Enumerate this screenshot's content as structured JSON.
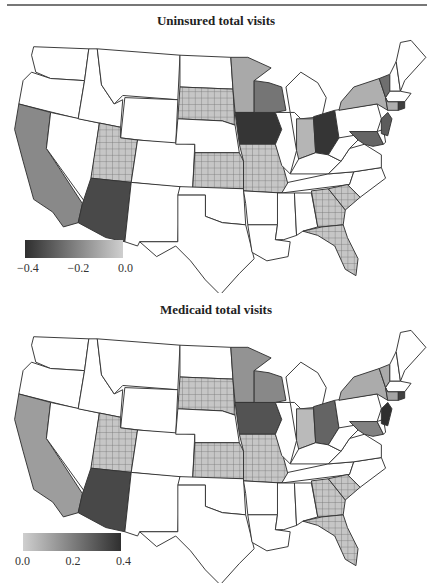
{
  "chart_data": [
    {
      "type": "choropleth",
      "title": "Uninsured total visits",
      "colorbar": {
        "ticks": [
          "−0.4",
          "−0.2",
          "0.0"
        ],
        "range": [
          -0.5,
          0.0
        ],
        "low_color": "#2f2f2f",
        "high_color": "#cfcfcf"
      },
      "hatched_note": "Cross-hatched states: grid-pattern fill",
      "states": {
        "IA": -0.48,
        "OH": -0.48,
        "AZ": -0.42,
        "NJ": -0.36,
        "MD": -0.33,
        "VT": -0.3,
        "WI": -0.28,
        "CA": -0.22,
        "RI": -0.45,
        "MN": -0.12,
        "NY": -0.1,
        "IN": -0.08,
        "CT": -0.1,
        "hatched": [
          "SD",
          "UT",
          "KS",
          "MO",
          "GA",
          "SC",
          "FL"
        ],
        "white": [
          "WA",
          "OR",
          "ID",
          "MT",
          "WY",
          "NV",
          "CO",
          "NM",
          "TX",
          "OK",
          "NE",
          "ND",
          "AR",
          "LA",
          "MS",
          "AL",
          "TN",
          "KY",
          "IL",
          "MI",
          "PA",
          "WV",
          "VA",
          "NC",
          "ME",
          "NH",
          "MA",
          "DE"
        ]
      }
    },
    {
      "type": "choropleth",
      "title": "Medicaid total visits",
      "colorbar": {
        "ticks": [
          "0.0",
          "0.2",
          "0.4"
        ],
        "range": [
          0.0,
          0.45
        ],
        "low_color": "#cfcfcf",
        "high_color": "#2f2f2f"
      },
      "states": {
        "NJ": 0.45,
        "AZ": 0.38,
        "IA": 0.35,
        "OH": 0.3,
        "RI": 0.4,
        "MD": 0.22,
        "WI": 0.2,
        "MN": 0.17,
        "CA": 0.14,
        "NY": 0.1,
        "VT": 0.1,
        "CT": 0.12,
        "IN": 0.06,
        "hatched": [
          "SD",
          "UT",
          "KS",
          "MO",
          "GA",
          "SC",
          "FL"
        ],
        "white": [
          "WA",
          "OR",
          "ID",
          "MT",
          "WY",
          "NV",
          "CO",
          "NM",
          "TX",
          "OK",
          "NE",
          "ND",
          "AR",
          "LA",
          "MS",
          "AL",
          "TN",
          "KY",
          "IL",
          "MI",
          "PA",
          "WV",
          "VA",
          "NC",
          "ME",
          "NH",
          "MA",
          "DE"
        ]
      }
    }
  ],
  "panels": [
    {
      "title": "Uninsured total visits",
      "ticks": [
        "−0.4",
        "−0.2",
        "0.0"
      ]
    },
    {
      "title": "Medicaid total visits",
      "ticks": [
        "0.0",
        "0.2",
        "0.4"
      ]
    }
  ],
  "colors": {
    "darkest": "#2f2f2f",
    "dark": "#4a4a4a",
    "mid": "#6e6e6e",
    "midlight": "#8f8f8f",
    "light": "#aaaaaa",
    "lightest": "#c4c4c4",
    "hatch_bg": "#c6c6c6",
    "hatch_line": "#707070"
  }
}
